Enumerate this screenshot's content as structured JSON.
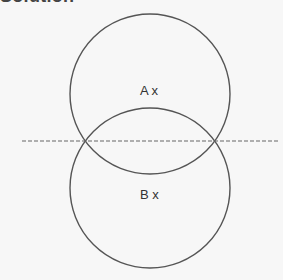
{
  "title": "Solution",
  "diagram": {
    "circle_a": {
      "label": "A x",
      "cx": 150,
      "cy": 94,
      "r": 80
    },
    "circle_b": {
      "label": "B x",
      "cx": 150,
      "cy": 188,
      "r": 80
    },
    "dashed_line": {
      "x1": 22,
      "y1": 141,
      "x2": 278,
      "y2": 141
    },
    "stroke_color": "#555555",
    "dash_color": "#666666"
  }
}
